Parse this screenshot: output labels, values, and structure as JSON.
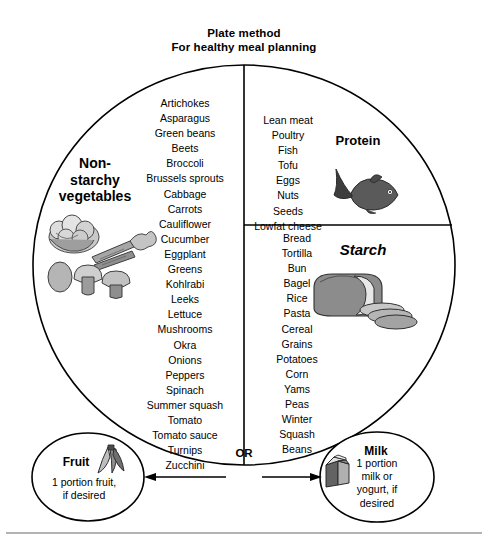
{
  "title": {
    "line1": "Plate method",
    "line2": "For healthy meal planning"
  },
  "plate": {
    "sections": {
      "vegetables": {
        "label_line1": "Non-",
        "label_line2": "starchy",
        "label_line3": "vegetables",
        "items": [
          "Artichokes",
          "Asparagus",
          "Green beans",
          "Beets",
          "Broccoli",
          "Brussels sprouts",
          "Cabbage",
          "Carrots",
          "Cauliflower",
          "Cucumber",
          "Eggplant",
          "Greens",
          "Kohlrabi",
          "Leeks",
          "Lettuce",
          "Mushrooms",
          "Okra",
          "Onions",
          "Peppers",
          "Spinach",
          "Summer squash",
          "Tomato",
          "Tomato sauce",
          "Turnips",
          "Zucchini"
        ],
        "art_name": "vegetables-illustration"
      },
      "protein": {
        "label": "Protein",
        "items": [
          "Lean meat",
          "Poultry",
          "Fish",
          "Tofu",
          "Eggs",
          "Nuts",
          "Seeds",
          "Lowfat cheese"
        ],
        "art_name": "fish-illustration"
      },
      "starch": {
        "label": "Starch",
        "items": [
          "Bread",
          "Tortilla",
          "Bun",
          "Bagel",
          "Rice",
          "Pasta",
          "Cereal",
          "Grains",
          "Potatoes",
          "Corn",
          "Yams",
          "Peas",
          "Winter",
          "Squash",
          "Beans"
        ],
        "art_name": "bread-loaf-illustration"
      }
    }
  },
  "connector": {
    "or_label": "OR"
  },
  "side_items": {
    "fruit": {
      "title": "Fruit",
      "body_line1": "1 portion fruit,",
      "body_line2": "if desired",
      "art_name": "banana-illustration"
    },
    "milk": {
      "title": "Milk",
      "body_line1": "1 portion",
      "body_line2": "milk or",
      "body_line3": "yogurt, if",
      "body_line4": "desired",
      "art_name": "milk-carton-illustration"
    }
  },
  "colors": {
    "stroke": "#000000",
    "background": "#ffffff",
    "art_light": "#d8d8d8",
    "art_mid": "#a8a8a8",
    "art_dark": "#6b6b6b",
    "art_darkest": "#3d3d3d",
    "footer_rule": "#9a9a9a"
  }
}
